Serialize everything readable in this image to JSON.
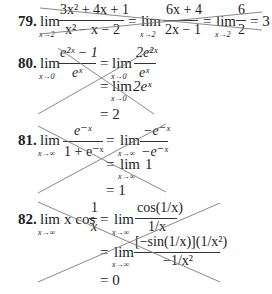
{
  "problems": [
    {
      "number": "79.",
      "lines": [
        {
          "lim1": "lim",
          "sub1": "x→2",
          "num1": "3x² + 4x + 1",
          "den1": "x² − x − 2",
          "eq1": "=",
          "lim2": "lim",
          "sub2": "x→2",
          "num2": "6x + 4",
          "den2": "2x − 1",
          "eq2": "=",
          "lim3": "lim",
          "sub3": "x→2",
          "num3": "6",
          "den3": "2",
          "eq3": "= 3"
        }
      ],
      "crossed_out": true
    },
    {
      "number": "80.",
      "line1": {
        "lim": "lim",
        "sub": "x→0",
        "num": "e²ˣ − 1",
        "den": "eˣ",
        "eq": "=",
        "lim2": "lim",
        "sub2": "x→0",
        "num2": "2e²ˣ",
        "den2": "eˣ"
      },
      "line2": {
        "eq": "=",
        "lim": "lim",
        "sub": "x→0",
        "expr": "2eˣ"
      },
      "line3": {
        "eq": "= 2"
      },
      "crossed_out": true
    },
    {
      "number": "81.",
      "line1": {
        "lim": "lim",
        "sub": "x→∞",
        "num": "e⁻ˣ",
        "den": "1 + e⁻ˣ",
        "eq": "=",
        "lim2": "lim",
        "sub2": "x→∞",
        "num2": "−e⁻ˣ",
        "den2": "−e⁻ˣ"
      },
      "line2": {
        "eq": "=",
        "lim": "lim",
        "sub": "x→∞",
        "expr": "1"
      },
      "line3": {
        "eq": "= 1"
      },
      "crossed_out": true
    },
    {
      "number": "82.",
      "line1": {
        "lim": "lim",
        "sub": "x→∞",
        "pre": "x cos",
        "num": "1",
        "den": "x",
        "eq": "=",
        "lim2": "lim",
        "sub2": "x→∞",
        "num2": "cos(1/x)",
        "den2": "1/x"
      },
      "line2": {
        "eq": "=",
        "lim": "lim",
        "sub": "x→∞",
        "num": "[−sin(1/x)](1/x²)",
        "den": "−1/x²"
      },
      "line3": {
        "eq": "= 0"
      },
      "crossed_out": true
    }
  ],
  "colors": {
    "text": "#222222",
    "strike": "#7a7a7a",
    "background": "#ffffff"
  }
}
